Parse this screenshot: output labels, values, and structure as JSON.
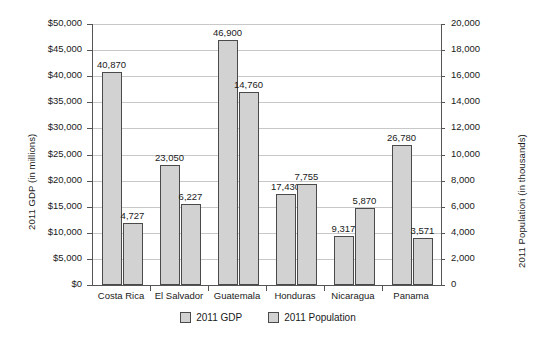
{
  "chart_data": {
    "type": "bar",
    "title": "",
    "subtitle": "",
    "xlabel": "",
    "categories": [
      "Costa Rica",
      "El Salvador",
      "Guatemala",
      "Honduras",
      "Nicaragua",
      "Panama"
    ],
    "series": [
      {
        "name": "2011 GDP",
        "axis": "left",
        "unit": "millions USD",
        "values": [
          40870,
          23050,
          46900,
          17430,
          9317,
          26780
        ],
        "labels": [
          "40,870",
          "23,050",
          "46,900",
          "17,430",
          "9,317",
          "26,780"
        ],
        "color": "#d2d2d2"
      },
      {
        "name": "2011 Population",
        "axis": "right",
        "unit": "thousands",
        "values": [
          4727,
          6227,
          14760,
          7755,
          5870,
          3571
        ],
        "labels": [
          "4,727",
          "6,227",
          "14,760",
          "7,755",
          "5,870",
          "3,571"
        ],
        "color": "#d2d2d2"
      }
    ],
    "left_axis": {
      "label": "2011 GDP (in millions)",
      "ylim": [
        0,
        50000
      ],
      "tick_step": 5000,
      "ticks": [
        50000,
        45000,
        40000,
        35000,
        30000,
        25000,
        20000,
        15000,
        10000,
        5000,
        0
      ],
      "tick_labels": [
        "$50,000",
        "$45,000",
        "$40,000",
        "$35,000",
        "$30,000",
        "$25,000",
        "$20,000",
        "$15,000",
        "$10,000",
        "$5,000",
        "$0"
      ]
    },
    "right_axis": {
      "label": "2011 Population (in thousands)",
      "ylim": [
        0,
        20000
      ],
      "tick_step": 2000,
      "ticks": [
        20000,
        18000,
        16000,
        14000,
        12000,
        10000,
        8000,
        6000,
        4000,
        2000,
        0
      ],
      "tick_labels": [
        "20,000",
        "18,000",
        "16,000",
        "14,000",
        "12,000",
        "10,000",
        "8,000",
        "6,000",
        "4,000",
        "2,000",
        "0"
      ]
    },
    "grid": true,
    "legend_position": "bottom",
    "legend": [
      "2011 GDP",
      "2011 Population"
    ]
  }
}
